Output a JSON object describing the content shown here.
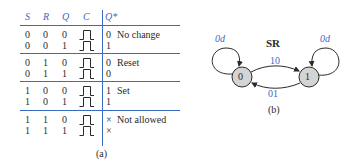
{
  "table": {
    "headers": [
      "S",
      "R",
      "Q",
      "C",
      "Q*"
    ],
    "clock_icon": "rising-pulse-icon",
    "groups": [
      {
        "label": "No change",
        "rows": [
          {
            "S": "0",
            "R": "0",
            "Q": "0",
            "Qstar": "0"
          },
          {
            "S": "0",
            "R": "0",
            "Q": "1",
            "Qstar": "1"
          }
        ]
      },
      {
        "label": "Reset",
        "rows": [
          {
            "S": "0",
            "R": "1",
            "Q": "0",
            "Qstar": "0"
          },
          {
            "S": "0",
            "R": "1",
            "Q": "1",
            "Qstar": "0"
          }
        ]
      },
      {
        "label": "Set",
        "rows": [
          {
            "S": "1",
            "R": "0",
            "Q": "0",
            "Qstar": "1"
          },
          {
            "S": "1",
            "R": "0",
            "Q": "1",
            "Qstar": "1"
          }
        ]
      },
      {
        "label": "Not allowed",
        "rows": [
          {
            "S": "1",
            "R": "1",
            "Q": "0",
            "Qstar": "×"
          },
          {
            "S": "1",
            "R": "1",
            "Q": "1",
            "Qstar": "×"
          }
        ]
      }
    ],
    "caption": "(a)"
  },
  "diagram": {
    "title": "SR",
    "states": [
      {
        "id": "0",
        "label": "0"
      },
      {
        "id": "1",
        "label": "1"
      }
    ],
    "transitions": [
      {
        "from": "0",
        "to": "0",
        "label": "0d"
      },
      {
        "from": "0",
        "to": "1",
        "label": "10"
      },
      {
        "from": "1",
        "to": "0",
        "label": "01"
      },
      {
        "from": "1",
        "to": "1",
        "label": "0d"
      }
    ],
    "caption": "(b)"
  },
  "colors": {
    "accent": "#3a6bc4",
    "node_fill": "#d4d4d4",
    "text": "#2a2a2a"
  }
}
